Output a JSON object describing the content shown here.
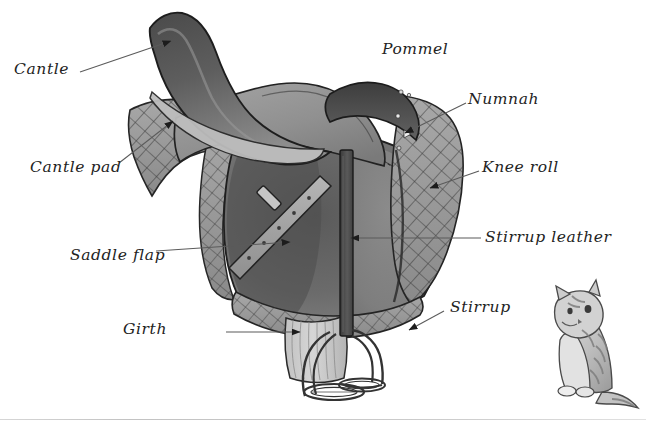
{
  "figure": {
    "kind": "labelled-illustration",
    "background_color": "#ffffff",
    "ink_color": "#232323",
    "line_color": "#555555"
  },
  "labels": [
    {
      "id": "cantle",
      "text": "Cantle",
      "x": 14,
      "y": 62,
      "leader": true,
      "arrow": true
    },
    {
      "id": "cantle-pad",
      "text": "Cantle pad",
      "x": 30,
      "y": 160,
      "leader": true,
      "arrow": true
    },
    {
      "id": "pommel",
      "text": "Pommel",
      "x": 382,
      "y": 42,
      "leader": false,
      "arrow": false
    },
    {
      "id": "numnah",
      "text": "Numnah",
      "x": 468,
      "y": 92,
      "leader": true,
      "arrow": true
    },
    {
      "id": "knee-roll",
      "text": "Knee roll",
      "x": 482,
      "y": 160,
      "leader": true,
      "arrow": true
    },
    {
      "id": "saddle-flap",
      "text": "Saddle flap",
      "x": 70,
      "y": 248,
      "leader": true,
      "arrow": true
    },
    {
      "id": "stirrup-leather",
      "text": "Stirrup leather",
      "x": 485,
      "y": 230,
      "leader": true,
      "arrow": true
    },
    {
      "id": "girth",
      "text": "Girth",
      "x": 123,
      "y": 322,
      "leader": true,
      "arrow": true
    },
    {
      "id": "stirrup",
      "text": "Stirrup",
      "x": 450,
      "y": 300,
      "leader": true,
      "arrow": true
    }
  ],
  "parts": [
    {
      "id": "cantle",
      "name": "Cantle"
    },
    {
      "id": "cantle-pad",
      "name": "Cantle pad"
    },
    {
      "id": "pommel",
      "name": "Pommel"
    },
    {
      "id": "numnah",
      "name": "Numnah"
    },
    {
      "id": "knee-roll",
      "name": "Knee roll"
    },
    {
      "id": "saddle-flap",
      "name": "Saddle flap"
    },
    {
      "id": "stirrup-leather",
      "name": "Stirrup leather"
    },
    {
      "id": "girth",
      "name": "Girth"
    },
    {
      "id": "stirrup",
      "name": "Stirrup"
    },
    {
      "id": "cat",
      "name": "Cat"
    }
  ]
}
